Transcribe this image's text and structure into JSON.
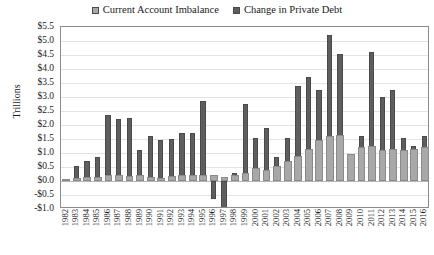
{
  "chart_data": {
    "type": "bar",
    "title": "",
    "xlabel": "",
    "ylabel": "Trillions",
    "ylim": [
      -1.0,
      5.5
    ],
    "ytick_step": 0.5,
    "ytick_labels": [
      "$5.5",
      "$5.0",
      "$4.5",
      "$4.0",
      "$3.5",
      "$3.0",
      "$2.5",
      "$2.0",
      "$1.5",
      "$1.0",
      "$0.5",
      "$0.0",
      "-$0.5",
      "-$1.0"
    ],
    "ytick_values": [
      5.5,
      5.0,
      4.5,
      4.0,
      3.5,
      3.0,
      2.5,
      2.0,
      1.5,
      1.0,
      0.5,
      0.0,
      -0.5,
      -1.0
    ],
    "grid": true,
    "legend_position": "top-center",
    "categories": [
      "1982",
      "1983",
      "1984",
      "1985",
      "1986",
      "1987",
      "1988",
      "1989",
      "1990",
      "1991",
      "1992",
      "1993",
      "1994",
      "1995",
      "1996",
      "1997",
      "1998",
      "1999",
      "2000",
      "2001",
      "2002",
      "2003",
      "2004",
      "2005",
      "2006",
      "2007",
      "2008",
      "2009",
      "2010",
      "2011",
      "2012",
      "2013",
      "2014",
      "2015",
      "2016"
    ],
    "series": [
      {
        "name": "Current Account Imbalance",
        "color": "#a8a8a8",
        "values": [
          0.05,
          0.1,
          0.15,
          0.15,
          0.2,
          0.22,
          0.18,
          0.2,
          0.15,
          0.1,
          0.18,
          0.2,
          0.22,
          0.22,
          0.22,
          0.15,
          0.22,
          0.3,
          0.45,
          0.4,
          0.55,
          0.7,
          0.9,
          1.15,
          1.45,
          1.6,
          1.65,
          0.95,
          1.2,
          1.25,
          1.1,
          1.15,
          1.1,
          1.15,
          1.2
        ]
      },
      {
        "name": "Change in Private Debt",
        "color": "#5e5e5e",
        "values": [
          0.08,
          0.55,
          0.7,
          0.85,
          2.35,
          2.2,
          2.25,
          1.1,
          1.6,
          1.45,
          1.5,
          1.7,
          1.7,
          2.85,
          -0.65,
          -0.95,
          0.3,
          2.75,
          1.55,
          1.9,
          0.85,
          1.55,
          3.4,
          3.7,
          3.25,
          5.2,
          4.55,
          0.2,
          1.6,
          4.6,
          3.0,
          3.25,
          1.55,
          1.25,
          1.6
        ]
      }
    ]
  },
  "legend": {
    "entries": [
      {
        "label": "Current Account Imbalance",
        "color": "#a8a8a8"
      },
      {
        "label": "Change in Private Debt",
        "color": "#5e5e5e"
      }
    ]
  },
  "axis": {
    "y_title": "Trillions"
  }
}
